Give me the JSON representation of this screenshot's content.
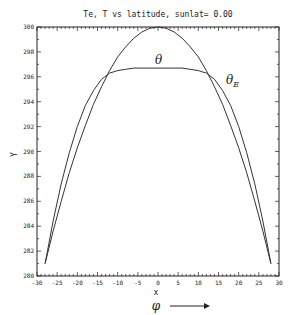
{
  "chart_data": {
    "type": "line",
    "title": "Te, T  vs latitude, sunlat=  0.00",
    "xlabel": "x",
    "xlabel_symbol": "φ",
    "ylabel": "Y",
    "xlim": [
      -30,
      30
    ],
    "ylim": [
      280,
      300
    ],
    "x_ticks": [
      -30,
      -25,
      -20,
      -15,
      -10,
      -5,
      0,
      5,
      10,
      15,
      20,
      25,
      30
    ],
    "x_tick_labels": [
      "-30",
      "-25",
      "-20",
      "-15",
      "-10",
      "-5",
      "0",
      "5",
      "10",
      "15",
      "20",
      "25",
      "30"
    ],
    "y_ticks": [
      280,
      282,
      284,
      286,
      288,
      290,
      292,
      294,
      296,
      298,
      300
    ],
    "y_tick_labels": [
      "280",
      "282",
      "284",
      "286",
      "288",
      "290",
      "292",
      "294",
      "296",
      "298",
      "300"
    ],
    "grid": false,
    "legend": "inline annotations",
    "series": [
      {
        "name": "θ_E",
        "label": "θE",
        "x": [
          -28,
          -26,
          -24,
          -22,
          -20,
          -18,
          -16,
          -14,
          -12,
          -10,
          -8,
          -6,
          -4,
          -2,
          0,
          2,
          4,
          6,
          8,
          10,
          12,
          14,
          16,
          18,
          20,
          22,
          24,
          26,
          28
        ],
        "values": [
          281.0,
          283.6,
          286.0,
          288.3,
          290.3,
          292.1,
          293.8,
          295.2,
          296.5,
          297.6,
          298.4,
          299.1,
          299.6,
          299.9,
          300.0,
          299.9,
          299.6,
          299.1,
          298.4,
          297.6,
          296.5,
          295.2,
          293.8,
          292.1,
          290.3,
          288.3,
          286.0,
          283.6,
          281.0
        ]
      },
      {
        "name": "θ",
        "label": "θ",
        "x": [
          -28,
          -26,
          -24,
          -22,
          -20,
          -18,
          -16,
          -14,
          -12,
          -10,
          -8,
          -6,
          -4,
          -2,
          0,
          2,
          4,
          6,
          8,
          10,
          12,
          14,
          16,
          18,
          20,
          22,
          24,
          26,
          28
        ],
        "values": [
          281.0,
          284.4,
          287.4,
          289.9,
          292.0,
          293.7,
          294.9,
          295.8,
          296.3,
          296.5,
          296.6,
          296.7,
          296.7,
          296.7,
          296.7,
          296.7,
          296.7,
          296.7,
          296.6,
          296.5,
          296.3,
          295.8,
          294.9,
          293.7,
          292.0,
          289.9,
          287.4,
          284.4,
          281.0
        ]
      }
    ],
    "annotations": [
      {
        "text": "θE",
        "x": 13.5,
        "y": 298.4
      },
      {
        "text": "θ",
        "x": 1,
        "y": 297.1
      }
    ],
    "arrow": {
      "direction": "right",
      "meaning": "increasing φ"
    }
  }
}
